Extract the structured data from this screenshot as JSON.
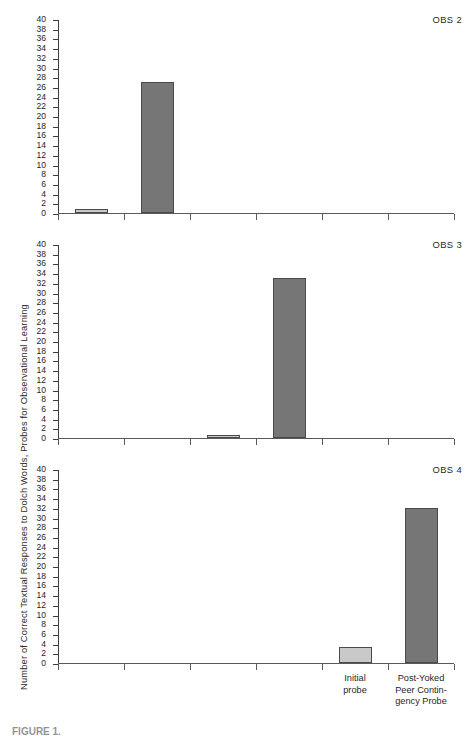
{
  "figure": {
    "ylabel": "Number of Correct Textual Responses to Dolch Words, Probes for Observational Learning",
    "caption": "FIGURE 1.",
    "light_color": "#c9c9c9",
    "dark_color": "#767676",
    "axis_color": "#4a4a4a"
  },
  "chart_data": {
    "type": "bar",
    "title": "",
    "xlabel": "",
    "ylabel": "Number of Correct Textual Responses to Dolch Words, Probes for Observational Learning",
    "ylim": [
      0,
      40
    ],
    "ytick_step": 2,
    "yticks": [
      0,
      2,
      4,
      6,
      8,
      10,
      12,
      14,
      16,
      18,
      20,
      22,
      24,
      26,
      28,
      30,
      32,
      34,
      36,
      38,
      40
    ],
    "grid": false,
    "legend": "none",
    "x_slots": 6,
    "x_tick_count": 7,
    "categories": [
      "",
      "",
      "",
      "",
      "Initial\nprobe",
      "Post-Yoked\nPeer Contin-\ngency Probe"
    ],
    "category_labels_visible_on": "OBS 4",
    "panels": [
      {
        "name": "OBS 2",
        "label": "OBS 2",
        "bars": [
          {
            "slot": 1,
            "value": 0.8,
            "shade": "light"
          },
          {
            "slot": 2,
            "value": 27.0,
            "shade": "dark"
          }
        ]
      },
      {
        "name": "OBS 3",
        "label": "OBS 3",
        "bars": [
          {
            "slot": 3,
            "value": 0.7,
            "shade": "light"
          },
          {
            "slot": 4,
            "value": 33.0,
            "shade": "dark"
          }
        ]
      },
      {
        "name": "OBS 4",
        "label": "OBS 4",
        "bars": [
          {
            "slot": 5,
            "value": 3.3,
            "shade": "light"
          },
          {
            "slot": 6,
            "value": 32.0,
            "shade": "dark"
          }
        ]
      }
    ]
  }
}
